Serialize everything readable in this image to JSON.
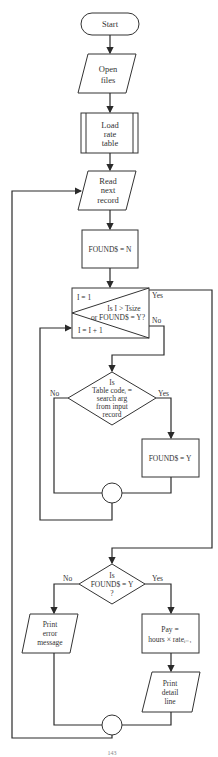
{
  "flowchart": {
    "start": "Start",
    "open_files": [
      "Open",
      "files"
    ],
    "load_rate_table": [
      "Load",
      "rate",
      "table"
    ],
    "read_next_record": [
      "Read",
      "next",
      "record"
    ],
    "init_found": "FOUND$ = N",
    "loop": {
      "init": "I = 1",
      "condition": [
        "Is I > Tsize",
        "or FOUND$ = Y?"
      ],
      "increment": "I = I + 1",
      "yes": "Yes",
      "no": "No"
    },
    "compare": {
      "lines": [
        "Is",
        "Table codeᵢ =",
        "search arg",
        "from input",
        "record"
      ],
      "yes": "Yes",
      "no": "No"
    },
    "set_found": "FOUND$ = Y",
    "check_found": {
      "lines": [
        "Is",
        "FOUND$ = Y",
        "?"
      ],
      "yes": "Yes",
      "no": "No"
    },
    "print_error": [
      "Print",
      "error",
      "message"
    ],
    "compute_pay": [
      "Pay =",
      "hours × rateᵢ₋₁"
    ],
    "print_detail": [
      "Print",
      "detail",
      "line"
    ],
    "caption": "143"
  }
}
